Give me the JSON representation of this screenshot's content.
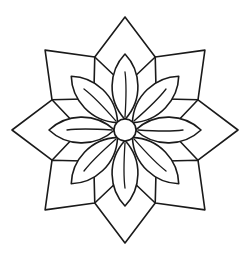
{
  "artwork": {
    "title": "Eight-Petal Floral Rosette",
    "kind": "line-art-outline",
    "subject": "mandala flower with octagonal star frame",
    "canvas": {
      "width": 248,
      "height": 262
    },
    "palette": {
      "background": "#ffffff",
      "stroke": "#1a1a1a",
      "fill": "#ffffff"
    },
    "geometry": {
      "center_x": 125,
      "center_y": 130,
      "core_radius": 11,
      "petal_count": 8,
      "frame_point_count": 8,
      "frame_outer_radius": 113,
      "frame_inner_radius": 79,
      "petal_tip_radius": 76,
      "petal_half_width": 20,
      "angle_step_degrees": 45,
      "petal_start_angle_degrees": -90,
      "frame_start_angle_degrees": -90
    },
    "extents": {
      "top_point_x": 126,
      "top_point_y": 13,
      "bottom_point_x": 126,
      "bottom_point_y": 248,
      "left_point_x": 14,
      "left_point_y": 131,
      "right_point_x": 238,
      "right_point_y": 131
    },
    "stroke_widths": {
      "outline": 1.6,
      "vein": 1.3
    },
    "layers": [
      {
        "name": "octagonal-star-frame",
        "elements": 8
      },
      {
        "name": "flower-petals",
        "elements": 8
      },
      {
        "name": "petal-veins",
        "elements": 8
      },
      {
        "name": "center-circle",
        "elements": 1
      }
    ]
  }
}
